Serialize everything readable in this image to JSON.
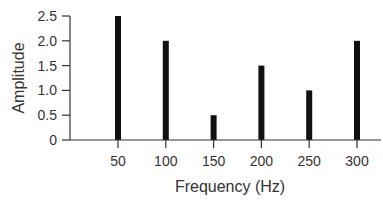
{
  "chart_data": {
    "type": "bar",
    "title": "",
    "xlabel": "Frequency (Hz)",
    "ylabel": "Amplitude",
    "categories": [
      "50",
      "100",
      "150",
      "200",
      "250",
      "300"
    ],
    "x": [
      50,
      100,
      150,
      200,
      250,
      300
    ],
    "values": [
      2.5,
      2.0,
      0.5,
      1.5,
      1.0,
      2.0
    ],
    "ylim": [
      0,
      2.5
    ],
    "yticks": [
      "0",
      "0.5",
      "1.0",
      "1.5",
      "2.0",
      "2.5"
    ],
    "grid": false,
    "legend": null,
    "bar_color": "#111111"
  }
}
